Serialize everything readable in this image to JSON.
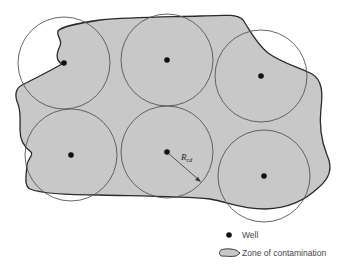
{
  "diagram": {
    "zone_fill": "#c8c8c8",
    "zone_stroke": "#2a2a2a",
    "circle_stroke": "#555555",
    "well_color": "#111111",
    "wells": [
      {
        "id": 1,
        "cx": 64,
        "cy": 63,
        "r": 46
      },
      {
        "id": 2,
        "cx": 167,
        "cy": 60,
        "r": 46
      },
      {
        "id": 3,
        "cx": 261,
        "cy": 76,
        "r": 46
      },
      {
        "id": 4,
        "cx": 71,
        "cy": 155,
        "r": 46
      },
      {
        "id": 5,
        "cx": 167,
        "cy": 152,
        "r": 46
      },
      {
        "id": 6,
        "cx": 264,
        "cy": 176,
        "r": 46
      }
    ],
    "radius_label": {
      "main": "R",
      "subscript": "cd"
    }
  },
  "legend": {
    "well_label": "Well",
    "zone_label": "Zone of contamination"
  }
}
